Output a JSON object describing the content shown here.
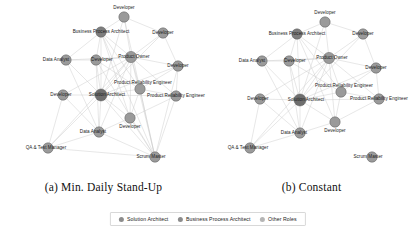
{
  "figure": {
    "panels": [
      {
        "id": "a",
        "caption": "(a) Min. Daily Stand-Up",
        "nodes": [
          {
            "label": "Developer",
            "x": 124,
            "y": 17,
            "r": 5.2,
            "role": "other"
          },
          {
            "label": "Business Process Architect",
            "x": 101,
            "y": 32,
            "r": 5.2,
            "role": "business_process_architect"
          },
          {
            "label": "Developer",
            "x": 163,
            "y": 33,
            "r": 5.2,
            "role": "other"
          },
          {
            "label": "Data Analyst",
            "x": 66,
            "y": 60,
            "r": 5.2,
            "role": "other"
          },
          {
            "label": "Developer",
            "x": 96,
            "y": 60,
            "r": 5.2,
            "role": "other"
          },
          {
            "label": "Product Owner",
            "x": 131,
            "y": 57,
            "r": 5.6,
            "role": "other"
          },
          {
            "label": "Developer",
            "x": 178,
            "y": 66,
            "r": 5.2,
            "role": "other"
          },
          {
            "label": "Developer",
            "x": 63,
            "y": 95,
            "r": 5.2,
            "role": "other"
          },
          {
            "label": "Solution Architect",
            "x": 101,
            "y": 95,
            "r": 6.0,
            "role": "solution_architect"
          },
          {
            "label": "Product Reliability Engineer",
            "x": 140,
            "y": 89,
            "r": 5.2,
            "role": "other"
          },
          {
            "label": "Product Reliability Engineer",
            "x": 176,
            "y": 96,
            "r": 5.2,
            "role": "other"
          },
          {
            "label": "Developer",
            "x": 130,
            "y": 118,
            "r": 5.2,
            "role": "other"
          },
          {
            "label": "Data Analyst",
            "x": 99,
            "y": 132,
            "r": 5.2,
            "role": "other"
          },
          {
            "label": "QA & Test Manager",
            "x": 48,
            "y": 148,
            "r": 5.2,
            "role": "other"
          },
          {
            "label": "Scrum Master",
            "x": 155,
            "y": 157,
            "r": 5.2,
            "role": "other"
          }
        ],
        "edges": [
          [
            0,
            1
          ],
          [
            0,
            5
          ],
          [
            0,
            2
          ],
          [
            0,
            8
          ],
          [
            1,
            5
          ],
          [
            1,
            8
          ],
          [
            1,
            4
          ],
          [
            1,
            3
          ],
          [
            1,
            9
          ],
          [
            1,
            11
          ],
          [
            2,
            5
          ],
          [
            2,
            6
          ],
          [
            2,
            8
          ],
          [
            3,
            4
          ],
          [
            3,
            8
          ],
          [
            3,
            5
          ],
          [
            3,
            12
          ],
          [
            4,
            5
          ],
          [
            4,
            8
          ],
          [
            4,
            9
          ],
          [
            4,
            12
          ],
          [
            5,
            6
          ],
          [
            5,
            8
          ],
          [
            5,
            9
          ],
          [
            5,
            10
          ],
          [
            5,
            11
          ],
          [
            5,
            12
          ],
          [
            5,
            13
          ],
          [
            5,
            7
          ],
          [
            6,
            9
          ],
          [
            6,
            10
          ],
          [
            6,
            8
          ],
          [
            7,
            8
          ],
          [
            7,
            12
          ],
          [
            7,
            13
          ],
          [
            8,
            9
          ],
          [
            8,
            10
          ],
          [
            8,
            11
          ],
          [
            8,
            12
          ],
          [
            8,
            13
          ],
          [
            9,
            10
          ],
          [
            9,
            11
          ],
          [
            10,
            11
          ],
          [
            11,
            12
          ],
          [
            12,
            13
          ],
          [
            14,
            0
          ],
          [
            14,
            1
          ],
          [
            14,
            5
          ],
          [
            14,
            8
          ],
          [
            14,
            9
          ],
          [
            14,
            10
          ],
          [
            14,
            11
          ],
          [
            14,
            12
          ],
          [
            14,
            13
          ],
          [
            14,
            4
          ],
          [
            14,
            6
          ]
        ],
        "node_label_offsets": [
          {
            "dx": 0,
            "dy": -9
          },
          {
            "dx": 0,
            "dy": 0
          },
          {
            "dx": 0,
            "dy": 0
          },
          {
            "dx": -10,
            "dy": 0
          },
          {
            "dx": 6,
            "dy": 0
          },
          {
            "dx": 3,
            "dy": 0
          },
          {
            "dx": 0,
            "dy": 0
          },
          {
            "dx": -2,
            "dy": 0
          },
          {
            "dx": 6,
            "dy": 0
          },
          {
            "dx": 3,
            "dy": -6
          },
          {
            "dx": 0,
            "dy": 0
          },
          {
            "dx": 0,
            "dy": 9
          },
          {
            "dx": -6,
            "dy": 0
          },
          {
            "dx": -2,
            "dy": 0
          },
          {
            "dx": -4,
            "dy": 0
          }
        ]
      },
      {
        "id": "b",
        "caption": "(b) Constant",
        "nodes": [
          {
            "label": "Developer",
            "x": 117,
            "y": 22,
            "r": 5.2,
            "role": "other"
          },
          {
            "label": "Business Process Architect",
            "x": 89,
            "y": 34,
            "r": 5.2,
            "role": "business_process_architect"
          },
          {
            "label": "Developer",
            "x": 155,
            "y": 34,
            "r": 5.2,
            "role": "other"
          },
          {
            "label": "Data Analyst",
            "x": 54,
            "y": 61,
            "r": 5.2,
            "role": "other"
          },
          {
            "label": "Developer",
            "x": 81,
            "y": 61,
            "r": 5.2,
            "role": "other"
          },
          {
            "label": "Product Owner",
            "x": 121,
            "y": 58,
            "r": 5.6,
            "role": "other"
          },
          {
            "label": "Developer",
            "x": 168,
            "y": 68,
            "r": 5.2,
            "role": "other"
          },
          {
            "label": "Developer",
            "x": 52,
            "y": 99,
            "r": 5.2,
            "role": "other"
          },
          {
            "label": "Solution Architect",
            "x": 92,
            "y": 100,
            "r": 6.0,
            "role": "solution_architect"
          },
          {
            "label": "Product Reliability Engineer",
            "x": 133,
            "y": 92,
            "r": 5.2,
            "role": "other"
          },
          {
            "label": "Product Reliability Engineer",
            "x": 171,
            "y": 99,
            "r": 5.2,
            "role": "other"
          },
          {
            "label": "Developer",
            "x": 127,
            "y": 122,
            "r": 5.2,
            "role": "other"
          },
          {
            "label": "Data Analyst",
            "x": 92,
            "y": 133,
            "r": 5.2,
            "role": "other"
          },
          {
            "label": "QA & Test Manager",
            "x": 42,
            "y": 148,
            "r": 5.2,
            "role": "other"
          },
          {
            "label": "Scrum Master",
            "x": 164,
            "y": 157,
            "r": 5.2,
            "role": "other"
          }
        ],
        "edges": [
          [
            0,
            1
          ],
          [
            0,
            5
          ],
          [
            0,
            2
          ],
          [
            0,
            8
          ],
          [
            1,
            5
          ],
          [
            1,
            8
          ],
          [
            1,
            4
          ],
          [
            1,
            3
          ],
          [
            1,
            9
          ],
          [
            1,
            11
          ],
          [
            2,
            5
          ],
          [
            2,
            6
          ],
          [
            2,
            8
          ],
          [
            3,
            4
          ],
          [
            3,
            8
          ],
          [
            3,
            5
          ],
          [
            3,
            12
          ],
          [
            4,
            5
          ],
          [
            4,
            8
          ],
          [
            4,
            9
          ],
          [
            4,
            12
          ],
          [
            5,
            6
          ],
          [
            5,
            8
          ],
          [
            5,
            9
          ],
          [
            5,
            10
          ],
          [
            5,
            11
          ],
          [
            5,
            12
          ],
          [
            5,
            13
          ],
          [
            5,
            7
          ],
          [
            6,
            9
          ],
          [
            6,
            10
          ],
          [
            6,
            8
          ],
          [
            7,
            8
          ],
          [
            7,
            12
          ],
          [
            7,
            13
          ],
          [
            8,
            9
          ],
          [
            8,
            10
          ],
          [
            8,
            11
          ],
          [
            8,
            12
          ],
          [
            8,
            13
          ],
          [
            9,
            10
          ],
          [
            9,
            11
          ],
          [
            10,
            11
          ],
          [
            11,
            12
          ],
          [
            12,
            13
          ]
        ],
        "node_label_offsets": [
          {
            "dx": 0,
            "dy": -9
          },
          {
            "dx": 0,
            "dy": 0
          },
          {
            "dx": 0,
            "dy": 0
          },
          {
            "dx": -10,
            "dy": 0
          },
          {
            "dx": 6,
            "dy": 0
          },
          {
            "dx": 3,
            "dy": 0
          },
          {
            "dx": 0,
            "dy": 0
          },
          {
            "dx": -2,
            "dy": 0
          },
          {
            "dx": 6,
            "dy": 0
          },
          {
            "dx": 3,
            "dy": -6
          },
          {
            "dx": 0,
            "dy": 0
          },
          {
            "dx": 0,
            "dy": 9
          },
          {
            "dx": -6,
            "dy": 0
          },
          {
            "dx": -2,
            "dy": 0
          },
          {
            "dx": -4,
            "dy": 0
          }
        ]
      }
    ],
    "legend": {
      "entries": [
        {
          "label": "Solution Architect",
          "color": "#8c8c8c"
        },
        {
          "label": "Business Process Architect",
          "color": "#8c8c8c"
        },
        {
          "label": "Other Roles",
          "color": "#b5b5b5"
        }
      ]
    },
    "style": {
      "node_fill_solution_architect": "#6e6e6e",
      "node_fill_business_process_architect": "#7d7d7d",
      "node_fill_other": "#9a9a9a",
      "node_stroke": "#5a5a5a",
      "edge_color": "#c9c9c9",
      "background": "#ffffff"
    }
  },
  "chart_data": {
    "type": "diagram",
    "subtype": "node-link graph",
    "panels": [
      {
        "name": "(a) Min. Daily Stand-Up",
        "node_count": 15,
        "edge_count": 55,
        "roles": [
          "Developer",
          "Business Process Architect",
          "Data Analyst",
          "Product Owner",
          "Solution Architect",
          "Product Reliability Engineer",
          "QA & Test Manager",
          "Scrum Master"
        ],
        "note": "Scrum Master is highly connected, with long edges radiating to most other nodes"
      },
      {
        "name": "(b) Constant",
        "node_count": 15,
        "edge_count": 44,
        "roles": [
          "Developer",
          "Business Process Architect",
          "Data Analyst",
          "Product Owner",
          "Solution Architect",
          "Product Reliability Engineer",
          "QA & Test Manager",
          "Scrum Master"
        ],
        "note": "Scrum Master is isolated at bottom-right with no edges"
      }
    ],
    "legend": [
      "Solution Architect",
      "Business Process Architect",
      "Other Roles"
    ]
  }
}
